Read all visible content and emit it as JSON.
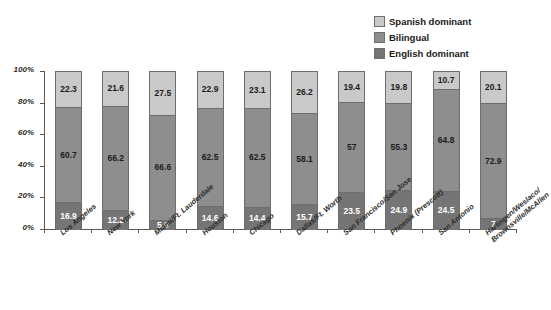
{
  "chart_data": {
    "type": "bar",
    "subtype": "stacked-bar-100",
    "title": "",
    "xlabel": "",
    "ylabel": "",
    "ylim": [
      0,
      100
    ],
    "grid": false,
    "legend_position": "top-right",
    "categories": [
      "Los Angeles",
      "New York",
      "Miami/Ft. Lauderdale",
      "Houston",
      "Chicago",
      "Dallas/Ft. Worth",
      "San Francisco/San Jose",
      "Phoenix (Prescott)",
      "San Antonio",
      "Harlingen/Weslaco/Brownsville/McAllen"
    ],
    "category_lines": [
      [
        "Los Angeles"
      ],
      [
        "New York"
      ],
      [
        "Miami/Ft. Lauderdale"
      ],
      [
        "Houston"
      ],
      [
        "Chicago"
      ],
      [
        "Dallas/Ft. Worth"
      ],
      [
        "San Francisco/San Jose"
      ],
      [
        "Phoenix (Prescott)"
      ],
      [
        "San Antonio"
      ],
      [
        "Harlingen/Weslaco/",
        "Brownsville/McAllen"
      ]
    ],
    "series": [
      {
        "name": "English dominant",
        "color": "#757575",
        "values": [
          16.9,
          12.2,
          5.9,
          14.6,
          14.4,
          15.7,
          23.5,
          24.9,
          24.5,
          7
        ]
      },
      {
        "name": "Bilingual",
        "color": "#8e8e8e",
        "values": [
          60.7,
          66.2,
          66.6,
          62.5,
          62.5,
          58.1,
          57,
          55.3,
          64.8,
          72.9
        ]
      },
      {
        "name": "Spanish dominant",
        "color": "#c9c9c9",
        "values": [
          22.3,
          21.6,
          27.5,
          22.9,
          23.1,
          26.2,
          19.4,
          19.8,
          10.7,
          20.1
        ]
      }
    ],
    "yticks": [
      0,
      20,
      40,
      60,
      80,
      100
    ],
    "ytick_labels": [
      "0%",
      "20%",
      "40%",
      "60%",
      "80%",
      "100%"
    ]
  },
  "legend": {
    "items": [
      {
        "label": "Spanish dominant",
        "color": "#c9c9c9"
      },
      {
        "label": "Bilingual",
        "color": "#8e8e8e"
      },
      {
        "label": "English dominant",
        "color": "#757575"
      }
    ]
  }
}
